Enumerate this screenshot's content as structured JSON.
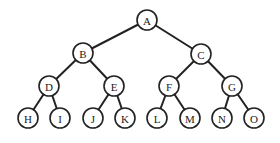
{
  "diagram": {
    "type": "binary-tree",
    "node_radius": 10,
    "stroke_color": "#222222",
    "fill_color": "#ffffff",
    "nodes": [
      {
        "id": "A",
        "label": "A",
        "x": 147,
        "y": 20
      },
      {
        "id": "B",
        "label": "B",
        "x": 83,
        "y": 53
      },
      {
        "id": "C",
        "label": "C",
        "x": 201,
        "y": 54
      },
      {
        "id": "D",
        "label": "D",
        "x": 49,
        "y": 86
      },
      {
        "id": "E",
        "label": "E",
        "x": 114,
        "y": 86
      },
      {
        "id": "F",
        "label": "F",
        "x": 169,
        "y": 86
      },
      {
        "id": "G",
        "label": "G",
        "x": 232,
        "y": 86
      },
      {
        "id": "H",
        "label": "H",
        "x": 28,
        "y": 118
      },
      {
        "id": "I",
        "label": "I",
        "x": 60,
        "y": 118
      },
      {
        "id": "J",
        "label": "J",
        "x": 93,
        "y": 118
      },
      {
        "id": "K",
        "label": "K",
        "x": 125,
        "y": 118
      },
      {
        "id": "L",
        "label": "L",
        "x": 157,
        "y": 118
      },
      {
        "id": "M",
        "label": "M",
        "x": 190,
        "y": 118
      },
      {
        "id": "N",
        "label": "N",
        "x": 222,
        "y": 118
      },
      {
        "id": "O",
        "label": "O",
        "x": 254,
        "y": 118
      }
    ],
    "edges": [
      {
        "from": "A",
        "to": "B"
      },
      {
        "from": "A",
        "to": "C"
      },
      {
        "from": "B",
        "to": "D"
      },
      {
        "from": "B",
        "to": "E"
      },
      {
        "from": "C",
        "to": "F"
      },
      {
        "from": "C",
        "to": "G"
      },
      {
        "from": "D",
        "to": "H"
      },
      {
        "from": "D",
        "to": "I"
      },
      {
        "from": "E",
        "to": "J"
      },
      {
        "from": "E",
        "to": "K"
      },
      {
        "from": "F",
        "to": "L"
      },
      {
        "from": "F",
        "to": "M"
      },
      {
        "from": "G",
        "to": "N"
      },
      {
        "from": "G",
        "to": "O"
      }
    ]
  }
}
